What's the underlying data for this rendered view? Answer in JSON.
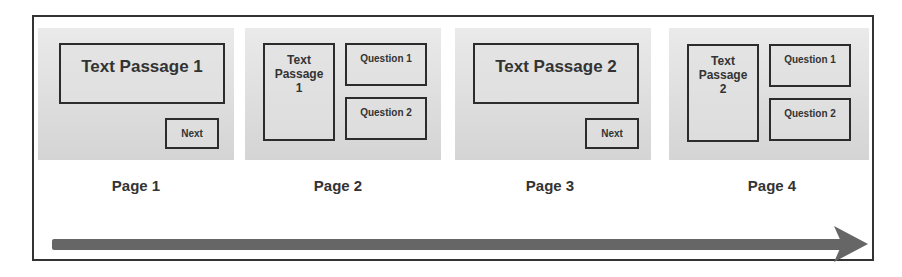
{
  "pages": [
    {
      "label": "Page 1",
      "passage": "Text Passage 1",
      "button": "Next"
    },
    {
      "label": "Page 2",
      "passage": "Text Passage 1",
      "questions": [
        "Question 1",
        "Question 2"
      ]
    },
    {
      "label": "Page 3",
      "passage": "Text Passage 2",
      "button": "Next"
    },
    {
      "label": "Page 4",
      "passage": "Text Passage 2",
      "questions": [
        "Question 1",
        "Question 2"
      ]
    }
  ],
  "colors": {
    "panel": "#dcdcdc",
    "border": "#2c2c2c",
    "arrow": "#666666"
  }
}
